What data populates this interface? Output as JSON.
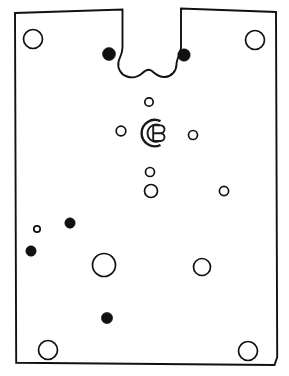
{
  "figure": {
    "background_color": "#ffffff",
    "line_color": "#111111",
    "fill_color": "#111111",
    "width": 289,
    "height": 376
  },
  "logo": {
    "name": "cb-monogram",
    "letter": "B",
    "description": "Concentric C arcs enclosing a letter B",
    "center_x": 153,
    "center_y": 133,
    "outer_radius": 13.5,
    "inner_radius": 9.5,
    "color": "#1a1a1a"
  },
  "outline": {
    "name": "panel-outline",
    "points": "15,13 122,9 122,48 128,60 133,71 140,75 146,72 152,69 158,72 164,75 170,71 175,60 181,47 181,8 276,12 277,357 274,365 16,363 14,190",
    "stroke_width": 1.9,
    "notch_label": "keyhole-notch"
  },
  "holes": {
    "open": [
      {
        "name": "hole-top-left-corner",
        "cx": 33,
        "cy": 39,
        "r": 9.5
      },
      {
        "name": "hole-top-right-corner",
        "cx": 255,
        "cy": 40,
        "r": 9.5
      },
      {
        "name": "hole-bottom-left-corner",
        "cx": 48,
        "cy": 350,
        "r": 9.5
      },
      {
        "name": "hole-bottom-right-corner",
        "cx": 248,
        "cy": 351,
        "r": 9.5
      },
      {
        "name": "hole-center-top-small",
        "cx": 149,
        "cy": 102,
        "r": 4.2
      },
      {
        "name": "hole-center-left-small",
        "cx": 121,
        "cy": 131,
        "r": 4.8
      },
      {
        "name": "hole-center-right-small",
        "cx": 193,
        "cy": 135,
        "r": 4.5
      },
      {
        "name": "hole-center-below-small",
        "cx": 150,
        "cy": 172,
        "r": 4.5
      },
      {
        "name": "hole-center-below-medium",
        "cx": 151,
        "cy": 191,
        "r": 6.5
      },
      {
        "name": "hole-right-mid-small",
        "cx": 224,
        "cy": 191,
        "r": 4.6
      },
      {
        "name": "hole-left-tiny",
        "cx": 37,
        "cy": 229,
        "r": 3.2
      },
      {
        "name": "hole-lower-center-large",
        "cx": 104,
        "cy": 265,
        "r": 11.5
      },
      {
        "name": "hole-lower-right-medium",
        "cx": 202,
        "cy": 267,
        "r": 8.5
      }
    ],
    "filled": [
      {
        "name": "pin-top-left",
        "cx": 109,
        "cy": 54,
        "r": 6.5
      },
      {
        "name": "pin-top-right",
        "cx": 184,
        "cy": 55,
        "r": 6.2
      },
      {
        "name": "pin-left-upper",
        "cx": 70,
        "cy": 223,
        "r": 5.2
      },
      {
        "name": "pin-left-lower",
        "cx": 31,
        "cy": 251,
        "r": 5.2
      },
      {
        "name": "pin-bottom-center",
        "cx": 107,
        "cy": 318,
        "r": 5.6
      }
    ]
  },
  "counts": {
    "open_holes": 13,
    "filled_holes": 5
  }
}
